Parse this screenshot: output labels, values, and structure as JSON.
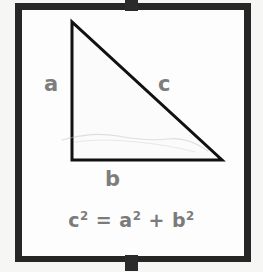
{
  "figure": {
    "frame": {
      "border_color": "#262626",
      "fill_color": "#fdfdfd",
      "outer_background": "#f6f6f4"
    },
    "triangle": {
      "stroke_color": "#111111",
      "fill_color": "#fbfbfb",
      "vertices": {
        "apex": [
          72,
          22
        ],
        "bottom_left": [
          72,
          160
        ],
        "bottom_right": [
          222,
          160
        ]
      },
      "right_angle_at": "bottom_left"
    },
    "labels": {
      "vertical_leg": "a",
      "hypotenuse": "c",
      "horizontal_leg": "b",
      "label_color": "#7d7d7d"
    },
    "formula": {
      "lhs_base": "c",
      "lhs_exponent": "2",
      "equals": "=",
      "term1_base": "a",
      "term1_exponent": "2",
      "plus": "+",
      "term2_base": "b",
      "term2_exponent": "2",
      "plain_text": "c² = a² + b²",
      "color": "#7b7b7b"
    },
    "tabs": {
      "top": "binding-tab-top",
      "bottom": "binding-tab-bottom"
    }
  }
}
